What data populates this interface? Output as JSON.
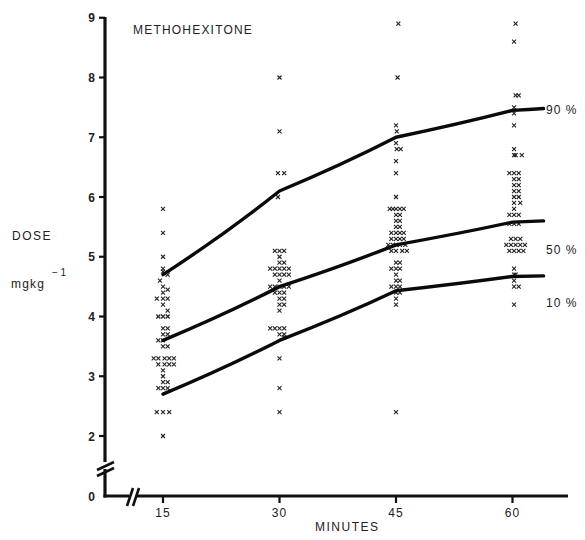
{
  "chart_data": {
    "type": "scatter",
    "title": "METHOHEXITONE",
    "xlabel": "MINUTES",
    "ylabel": "DOSE",
    "ylabel_units": "mgkg",
    "ylabel_units_exp": "− 1",
    "x_ticks": [
      15,
      30,
      45,
      60
    ],
    "x_tick_labels": [
      "15",
      "30",
      "45",
      "60"
    ],
    "y_ticks": [
      0,
      2,
      3,
      4,
      5,
      6,
      7,
      8,
      9
    ],
    "y_tick_labels": [
      "0",
      "2",
      "3",
      "4",
      "5",
      "6",
      "7",
      "8",
      "9"
    ],
    "ylim": [
      0,
      9
    ],
    "xlim": [
      0,
      65
    ],
    "axis_breaks": {
      "x": true,
      "y": true
    },
    "grid": false,
    "legend": "inline labels at right end of curves",
    "series": [
      {
        "name": "90 %",
        "type": "line",
        "x": [
          15,
          30,
          45,
          60,
          64
        ],
        "y": [
          4.7,
          6.1,
          7.0,
          7.45,
          7.48
        ]
      },
      {
        "name": "50 %",
        "type": "line",
        "x": [
          15,
          30,
          45,
          60,
          64
        ],
        "y": [
          3.6,
          4.5,
          5.2,
          5.58,
          5.6
        ]
      },
      {
        "name": "10 %",
        "type": "line",
        "x": [
          15,
          30,
          45,
          60,
          64
        ],
        "y": [
          2.7,
          3.6,
          4.43,
          4.67,
          4.68
        ]
      }
    ],
    "scatter_points": {
      "marker": "x",
      "t15": [
        [
          15,
          5.8
        ],
        [
          15,
          5.4
        ],
        [
          15,
          5.0
        ],
        [
          15,
          4.8
        ],
        [
          15,
          4.75
        ],
        [
          15.6,
          4.7
        ],
        [
          14.6,
          4.6
        ],
        [
          15,
          4.5
        ],
        [
          15.6,
          4.45
        ],
        [
          15,
          4.4
        ],
        [
          14.2,
          4.3
        ],
        [
          15,
          4.3
        ],
        [
          15.6,
          4.3
        ],
        [
          15,
          4.2
        ],
        [
          15.6,
          4.1
        ],
        [
          14.4,
          4.0
        ],
        [
          15,
          4.0
        ],
        [
          15.6,
          4.0
        ],
        [
          15,
          3.8
        ],
        [
          15.6,
          3.8
        ],
        [
          15,
          3.7
        ],
        [
          15.6,
          3.7
        ],
        [
          14.4,
          3.6
        ],
        [
          15,
          3.6
        ],
        [
          15.6,
          3.5
        ],
        [
          15,
          3.5
        ],
        [
          13.8,
          3.3
        ],
        [
          14.4,
          3.3
        ],
        [
          15.2,
          3.3
        ],
        [
          15.8,
          3.3
        ],
        [
          16.4,
          3.3
        ],
        [
          14.4,
          3.2
        ],
        [
          15.2,
          3.2
        ],
        [
          15.8,
          3.2
        ],
        [
          16.4,
          3.2
        ],
        [
          15,
          3.1
        ],
        [
          15,
          3.0
        ],
        [
          15,
          2.9
        ],
        [
          15.6,
          2.9
        ],
        [
          14.4,
          2.8
        ],
        [
          15,
          2.8
        ],
        [
          15.6,
          2.8
        ],
        [
          14.2,
          2.4
        ],
        [
          15,
          2.4
        ],
        [
          15.8,
          2.4
        ],
        [
          15,
          2.0
        ]
      ],
      "t30": [
        [
          30,
          8.0
        ],
        [
          30,
          7.1
        ],
        [
          29.8,
          6.4
        ],
        [
          30.6,
          6.4
        ],
        [
          29.8,
          6.0
        ],
        [
          29.4,
          5.1
        ],
        [
          30,
          5.1
        ],
        [
          30.6,
          5.1
        ],
        [
          30,
          5.0
        ],
        [
          30,
          4.9
        ],
        [
          30.6,
          4.9
        ],
        [
          28.8,
          4.8
        ],
        [
          29.4,
          4.8
        ],
        [
          30,
          4.8
        ],
        [
          30.6,
          4.8
        ],
        [
          31.2,
          4.8
        ],
        [
          29.4,
          4.7
        ],
        [
          30,
          4.7
        ],
        [
          30.6,
          4.7
        ],
        [
          31.2,
          4.7
        ],
        [
          30,
          4.6
        ],
        [
          28.8,
          4.5
        ],
        [
          29.4,
          4.5
        ],
        [
          30,
          4.5
        ],
        [
          30.6,
          4.5
        ],
        [
          31.2,
          4.5
        ],
        [
          29.4,
          4.4
        ],
        [
          30,
          4.4
        ],
        [
          30.6,
          4.4
        ],
        [
          30,
          4.3
        ],
        [
          30.6,
          4.3
        ],
        [
          30,
          4.2
        ],
        [
          30.6,
          4.2
        ],
        [
          30,
          4.1
        ],
        [
          30,
          3.8
        ],
        [
          30.6,
          3.8
        ],
        [
          28.8,
          3.8
        ],
        [
          29.4,
          3.8
        ],
        [
          30,
          3.7
        ],
        [
          30.6,
          3.7
        ],
        [
          30.6,
          3.65
        ],
        [
          30,
          3.3
        ],
        [
          30,
          2.8
        ],
        [
          30,
          2.4
        ]
      ],
      "t45": [
        [
          45.3,
          8.9
        ],
        [
          45.2,
          8.0
        ],
        [
          45,
          7.2
        ],
        [
          45.1,
          7.1
        ],
        [
          45,
          6.9
        ],
        [
          45.1,
          6.8
        ],
        [
          45.6,
          6.8
        ],
        [
          45,
          6.6
        ],
        [
          45,
          6.4
        ],
        [
          45,
          6.0
        ],
        [
          44.2,
          5.8
        ],
        [
          44.6,
          5.8
        ],
        [
          45,
          5.8
        ],
        [
          45.5,
          5.8
        ],
        [
          46,
          5.8
        ],
        [
          45,
          5.7
        ],
        [
          45.5,
          5.7
        ],
        [
          45,
          5.6
        ],
        [
          45.5,
          5.6
        ],
        [
          45,
          5.5
        ],
        [
          45.5,
          5.5
        ],
        [
          44.4,
          5.4
        ],
        [
          45,
          5.4
        ],
        [
          45.5,
          5.4
        ],
        [
          46,
          5.4
        ],
        [
          44.4,
          5.3
        ],
        [
          45,
          5.3
        ],
        [
          45.5,
          5.3
        ],
        [
          46,
          5.3
        ],
        [
          44,
          5.2
        ],
        [
          44.6,
          5.2
        ],
        [
          45,
          5.2
        ],
        [
          45.5,
          5.2
        ],
        [
          46.2,
          5.2
        ],
        [
          44.4,
          5.1
        ],
        [
          45,
          5.1
        ],
        [
          45.8,
          5.1
        ],
        [
          46.4,
          5.1
        ],
        [
          45,
          4.9
        ],
        [
          45.5,
          4.9
        ],
        [
          44.4,
          4.8
        ],
        [
          45,
          4.8
        ],
        [
          45.5,
          4.8
        ],
        [
          45,
          4.7
        ],
        [
          45,
          4.6
        ],
        [
          45.5,
          4.6
        ],
        [
          44.4,
          4.5
        ],
        [
          45,
          4.5
        ],
        [
          45.5,
          4.5
        ],
        [
          45,
          4.4
        ],
        [
          45.5,
          4.4
        ],
        [
          45,
          4.3
        ],
        [
          45,
          4.2
        ],
        [
          45,
          2.4
        ]
      ],
      "t60": [
        [
          60.4,
          8.9
        ],
        [
          60.2,
          8.6
        ],
        [
          60.4,
          7.7
        ],
        [
          60.8,
          7.7
        ],
        [
          60.2,
          7.5
        ],
        [
          60.2,
          7.4
        ],
        [
          60.2,
          7.2
        ],
        [
          60.2,
          6.8
        ],
        [
          60.2,
          6.7
        ],
        [
          60.4,
          6.7
        ],
        [
          61.2,
          6.7
        ],
        [
          59.6,
          6.4
        ],
        [
          60.2,
          6.4
        ],
        [
          60.8,
          6.4
        ],
        [
          60.2,
          6.3
        ],
        [
          60.8,
          6.3
        ],
        [
          60.2,
          6.2
        ],
        [
          60.8,
          6.2
        ],
        [
          60.2,
          6.1
        ],
        [
          60.8,
          6.1
        ],
        [
          60.2,
          6.0
        ],
        [
          60.8,
          6.0
        ],
        [
          60.2,
          5.9
        ],
        [
          61,
          5.9
        ],
        [
          60.2,
          5.8
        ],
        [
          59.6,
          5.7
        ],
        [
          60.2,
          5.7
        ],
        [
          60.8,
          5.7
        ],
        [
          59.6,
          5.55
        ],
        [
          60.2,
          5.55
        ],
        [
          60.8,
          5.55
        ],
        [
          59.8,
          5.3
        ],
        [
          60.4,
          5.3
        ],
        [
          61,
          5.3
        ],
        [
          59.2,
          5.2
        ],
        [
          59.8,
          5.2
        ],
        [
          60.4,
          5.2
        ],
        [
          61,
          5.2
        ],
        [
          61.6,
          5.2
        ],
        [
          59.6,
          5.1
        ],
        [
          60.2,
          5.1
        ],
        [
          60.8,
          5.1
        ],
        [
          61.4,
          5.1
        ],
        [
          60.2,
          4.8
        ],
        [
          60.2,
          4.7
        ],
        [
          60.4,
          4.7
        ],
        [
          60.2,
          4.6
        ],
        [
          60.2,
          4.5
        ],
        [
          60.8,
          4.5
        ],
        [
          60.2,
          4.2
        ]
      ]
    }
  },
  "labels": {
    "title": "METHOHEXITONE",
    "ylabel": "DOSE",
    "ylabel_units": "mgkg",
    "ylabel_units_exp": "− 1",
    "xlabel": "MINUTES",
    "curve_90": "90 %",
    "curve_50": "50 %",
    "curve_10": "10 %"
  }
}
